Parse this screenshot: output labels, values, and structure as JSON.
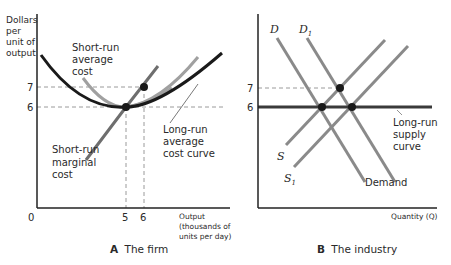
{
  "panel_a": {
    "caption_letter": "A",
    "caption_text": "The firm",
    "y_axis_label": [
      "Dollars",
      "per",
      "unit of",
      "output"
    ],
    "x_axis_label": [
      "Output",
      "(thousands of",
      "units per day)"
    ],
    "origin": "0",
    "y_ticks": [
      "7",
      "6"
    ],
    "x_ticks": [
      "5",
      "6"
    ],
    "labels": {
      "sr_avg_cost": [
        "Short-run",
        "average",
        "cost"
      ],
      "sr_marginal_cost": [
        "Short-run",
        "marginal",
        "cost"
      ],
      "lr_avg_cost": [
        "Long-run",
        "average",
        "cost curve"
      ]
    }
  },
  "panel_b": {
    "caption_letter": "B",
    "caption_text": "The industry",
    "x_axis_label": "Quantity (Q)",
    "y_ticks": [
      "7",
      "6"
    ],
    "curve_labels": {
      "D": "D",
      "D1": "D",
      "D1_sub": "1",
      "S": "S",
      "S1": "S",
      "S1_sub": "1",
      "demand": "Demand",
      "lr_supply": [
        "Long-run",
        "supply",
        "curve"
      ]
    }
  },
  "colors": {
    "axis": "#222222",
    "lrac": "#1a1a1a",
    "curve_gray": "#8a8a8a",
    "mc": "#6e6e6e",
    "dashed": "#9a9a9a",
    "point": "#1a1a1a"
  }
}
